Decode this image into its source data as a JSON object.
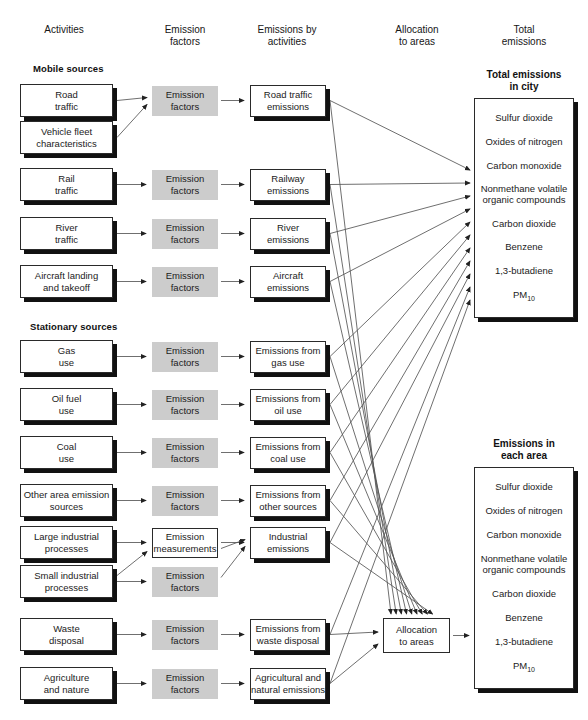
{
  "columns": [
    {
      "id": "activities",
      "label": "Activities",
      "x": 64,
      "y": 24
    },
    {
      "id": "emission-factors",
      "label": "Emission\nfactors",
      "x": 185,
      "y": 24
    },
    {
      "id": "emissions-by-activities",
      "label": "Emissions by\nactivities",
      "x": 287,
      "y": 24
    },
    {
      "id": "allocation-to-areas",
      "label": "Allocation\nto areas",
      "x": 417,
      "y": 24
    },
    {
      "id": "total-emissions",
      "label": "Total\nemissions",
      "x": 524,
      "y": 24
    }
  ],
  "groups": [
    {
      "id": "mobile-sources",
      "label": "Mobile sources",
      "x": 33,
      "y": 67
    },
    {
      "id": "stationary-sources",
      "label": "Stationary sources",
      "x": 30,
      "y": 325
    }
  ],
  "captions": [
    {
      "id": "total-emissions-in-city",
      "label": "Total emissions\nin city",
      "x": 524,
      "y": 71
    },
    {
      "id": "emissions-in-each-area",
      "label": "Emissions in\neach area",
      "x": 524,
      "y": 440
    }
  ],
  "rows": [
    {
      "id": "road-traffic",
      "activity": "Road\ntraffic",
      "factor": "Emission\nfactors",
      "factor_style": "gray",
      "emission": "Road traffic\nemissions",
      "y": 84
    },
    {
      "id": "vehicle-fleet",
      "activity": "Vehicle fleet\ncharacteristics",
      "factor": null,
      "factor_style": null,
      "emission": null,
      "y": 121
    },
    {
      "id": "rail-traffic",
      "activity": "Rail\ntraffic",
      "factor": "Emission\nfactors",
      "factor_style": "gray",
      "emission": "Railway\nemissions",
      "y": 168
    },
    {
      "id": "river-traffic",
      "activity": "River\ntraffic",
      "factor": "Emission\nfactors",
      "factor_style": "gray",
      "emission": "River\nemissions",
      "y": 217
    },
    {
      "id": "aircraft",
      "activity": "Aircraft landing\nand takeoff",
      "factor": "Emission\nfactors",
      "factor_style": "gray",
      "emission": "Aircraft\nemissions",
      "y": 265
    },
    {
      "id": "gas-use",
      "activity": "Gas\nuse",
      "factor": "Emission\nfactors",
      "factor_style": "gray",
      "emission": "Emissions from\ngas use",
      "y": 340
    },
    {
      "id": "oil-fuel-use",
      "activity": "Oil fuel\nuse",
      "factor": "Emission\nfactors",
      "factor_style": "gray",
      "emission": "Emissions from\noil use",
      "y": 388
    },
    {
      "id": "coal-use",
      "activity": "Coal\nuse",
      "factor": "Emission\nfactors",
      "factor_style": "gray",
      "emission": "Emissions from\ncoal use",
      "y": 436
    },
    {
      "id": "other-area-sources",
      "activity": "Other area emission\nsources",
      "factor": "Emission\nfactors",
      "factor_style": "gray",
      "emission": "Emissions from\nother sources",
      "y": 484
    },
    {
      "id": "large-industrial",
      "activity": "Large industrial\nprocesses",
      "factor": "Emission\nmeasurements",
      "factor_style": "plain",
      "emission": "Industrial\nemissions",
      "y": 526
    },
    {
      "id": "small-industrial",
      "activity": "Small industrial\nprocesses",
      "factor": "Emission\nfactors",
      "factor_style": "gray",
      "emission": null,
      "y": 565
    },
    {
      "id": "waste-disposal",
      "activity": "Waste\ndisposal",
      "factor": "Emission\nfactors",
      "factor_style": "gray",
      "emission": "Emissions from\nwaste disposal",
      "y": 618
    },
    {
      "id": "agriculture-nature",
      "activity": "Agriculture\nand nature",
      "factor": "Emission\nfactors",
      "factor_style": "gray",
      "emission": "Agricultural and\nnatural emissions",
      "y": 667
    }
  ],
  "allocation_node": {
    "id": "allocation-to-areas-node",
    "label": "Allocation\nto areas",
    "x": 383,
    "y": 618,
    "w": 67,
    "h": 35
  },
  "pollutants": [
    "Sulfur dioxide",
    "Oxides of nitrogen",
    "Carbon monoxide",
    "Nonmethane volatile\norganic compounds",
    "Carbon dioxide",
    "Benzene",
    "1,3-butadiene",
    "PM10"
  ],
  "pollutant_subscript": {
    "base": "PM",
    "sub": "10"
  },
  "boxes": {
    "total_emissions_city": {
      "x": 474,
      "y": 98,
      "w": 100,
      "h": 220
    },
    "emissions_each_area": {
      "x": 474,
      "y": 467,
      "w": 100,
      "h": 222
    }
  },
  "colors": {
    "factor_fill": "#cccccc",
    "box_fill": "#ffffff",
    "stroke": "#2a2a2a",
    "shadow": "#111111",
    "line": "#555555",
    "text": "#1b1b1b"
  },
  "geometry": {
    "activity_x": 20,
    "activity_w": 93,
    "activity_h": 33,
    "factor_x": 152,
    "factor_w": 66,
    "factor_h": 30,
    "emission_x": 250,
    "emission_w": 76,
    "emission_h": 32
  }
}
